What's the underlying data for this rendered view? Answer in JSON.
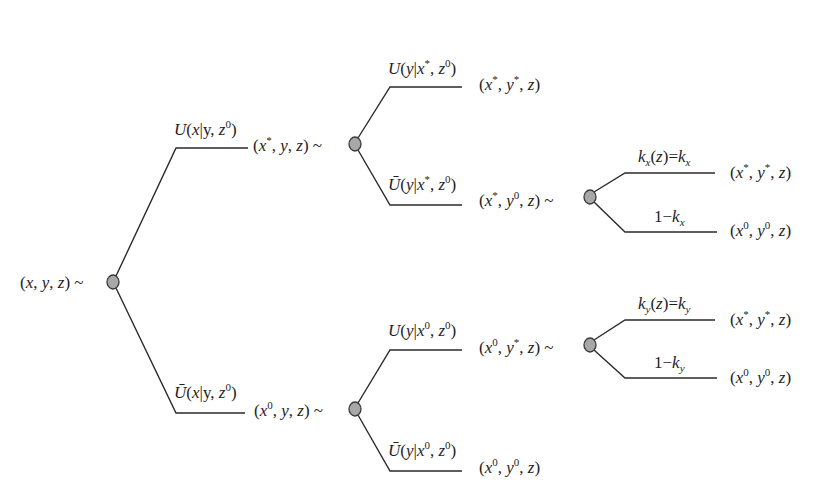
{
  "diagram": {
    "type": "probability-tree",
    "line_color": "#2a2a2a",
    "node_fill": "#a8a8a8",
    "node_stroke": "#3a3a3a",
    "nodes": {
      "root": {
        "label": "(x, y, z) ~"
      },
      "a": {
        "label": "(x*, y, z) ~"
      },
      "b": {
        "label": "(x0, y, z) ~"
      },
      "c": {
        "label": "(x*, y0, z) ~"
      },
      "d": {
        "label": "(x0, y*, z) ~"
      }
    },
    "edges": {
      "root_up": "U(x|y, z0)",
      "root_down": "Ū(x|y, z0)",
      "a_up": "U(y|x*, z0)",
      "a_down": "Ū(y|x*, z0)",
      "b_up": "U(y|x0, z0)",
      "b_down": "Ū(y|x0, z0)",
      "c_up": "kx(z)=kx",
      "c_down": "1−kx",
      "d_up": "ky(z)=ky",
      "d_down": "1−ky"
    },
    "outcomes": {
      "a_up": "(x*, y*, z)",
      "b_down": "(x0, y0, z)",
      "c_up": "(x*, y*, z)",
      "c_down": "(x0, y0, z)",
      "d_up": "(x*, y*, z)",
      "d_down": "(x0, y0, z)"
    },
    "text": {
      "x": "x",
      "y": "y",
      "z": "z",
      "U": "U",
      "k": "k",
      "star": "*",
      "zero": "0",
      "one_minus": "1−",
      "bar_u": "Ū",
      "open": "(",
      "close": ")",
      "comma": ", ",
      "bar": "|",
      "tilde": " ~",
      "eq": "=",
      "sx": "x",
      "sy": "y"
    }
  }
}
